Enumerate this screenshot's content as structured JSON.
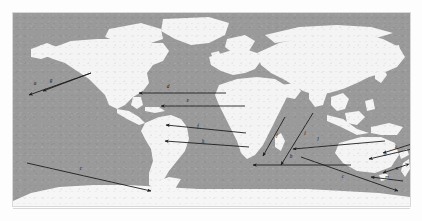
{
  "figure": {
    "type": "world-map-route-diagram",
    "colors": {
      "ocean": "#9a9a9a",
      "land": "#f4f4f4",
      "arrow": "#1d1d1d",
      "page": "#ffffff"
    },
    "frame": {
      "x": 13,
      "y": 13,
      "width": 397,
      "height": 193
    }
  },
  "routes": [
    {
      "id": "a",
      "label": "a",
      "label_x": 22,
      "label_y": 72,
      "x1": 78,
      "y1": 60,
      "x2": 16,
      "y2": 82,
      "arrow": "end",
      "region": "north-pacific-west"
    },
    {
      "id": "g",
      "label": "g",
      "label_x": 38,
      "label_y": 69,
      "x1": 78,
      "y1": 60,
      "x2": 30,
      "y2": 78,
      "arrow": "end",
      "region": "north-pacific"
    },
    {
      "id": "d",
      "label": "d",
      "label_x": 155,
      "label_y": 75,
      "x1": 213,
      "y1": 80,
      "x2": 126,
      "y2": 80,
      "arrow": "end",
      "region": "north-atlantic"
    },
    {
      "id": "e",
      "label": "e",
      "label_x": 175,
      "label_y": 89,
      "x1": 232,
      "y1": 93,
      "x2": 148,
      "y2": 93,
      "arrow": "end",
      "region": "central-atlantic"
    },
    {
      "id": "f",
      "label": "f",
      "label_x": 185,
      "label_y": 115,
      "x1": 233,
      "y1": 120,
      "x2": 153,
      "y2": 112,
      "arrow": "end",
      "region": "south-atlantic-north"
    },
    {
      "id": "h",
      "label": "h",
      "label_x": 190,
      "label_y": 130,
      "x1": 236,
      "y1": 134,
      "x2": 152,
      "y2": 128,
      "arrow": "end",
      "region": "south-atlantic-south"
    },
    {
      "id": "c",
      "label": "c",
      "label_x": 68,
      "label_y": 157,
      "x1": 14,
      "y1": 150,
      "x2": 138,
      "y2": 178,
      "arrow": "end",
      "region": "south-pacific-long"
    },
    {
      "id": "j",
      "label": "j",
      "label_x": 264,
      "label_y": 124,
      "x1": 272,
      "y1": 104,
      "x2": 250,
      "y2": 143,
      "arrow": "end",
      "region": "africa-east"
    },
    {
      "id": "i",
      "label": "i",
      "label_x": 292,
      "label_y": 122,
      "x1": 300,
      "y1": 100,
      "x2": 268,
      "y2": 152,
      "arrow": "end",
      "region": "indian-ocean-north"
    },
    {
      "id": "b",
      "label": "b",
      "label_x": 278,
      "label_y": 145,
      "x1": 338,
      "y1": 152,
      "x2": 240,
      "y2": 152,
      "arrow": "end",
      "region": "indian-ocean-south"
    },
    {
      "id": "l",
      "label": "l",
      "label_x": 305,
      "label_y": 128,
      "x1": 372,
      "y1": 128,
      "x2": 280,
      "y2": 136,
      "arrow": "end",
      "region": "australia-northwest"
    },
    {
      "id": "k",
      "label": "k",
      "label_x": 383,
      "label_y": 136,
      "x1": 402,
      "y1": 130,
      "x2": 370,
      "y2": 140,
      "arrow": "end",
      "region": "australia-northeast"
    },
    {
      "id": "o",
      "label": "o",
      "label_x": 372,
      "label_y": 143,
      "x1": 399,
      "y1": 136,
      "x2": 356,
      "y2": 146,
      "arrow": "end",
      "region": "coral-sea"
    },
    {
      "id": "n",
      "label": "n",
      "label_x": 384,
      "label_y": 157,
      "x1": 393,
      "y1": 152,
      "x2": 370,
      "y2": 160,
      "arrow": "both",
      "region": "new-caledonia"
    },
    {
      "id": "m",
      "label": "m",
      "label_x": 374,
      "label_y": 166,
      "x1": 390,
      "y1": 168,
      "x2": 358,
      "y2": 164,
      "arrow": "end",
      "region": "tasman-sea"
    },
    {
      "id": "c2",
      "label": "c",
      "label_x": 330,
      "label_y": 165,
      "x1": 288,
      "y1": 144,
      "x2": 385,
      "y2": 178,
      "arrow": "end",
      "region": "southern-ocean"
    }
  ]
}
